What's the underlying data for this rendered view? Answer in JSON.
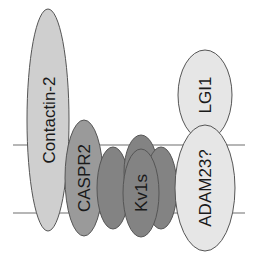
{
  "diagram": {
    "colors": {
      "background": "#ffffff",
      "membrane_line": "#6e6e6e",
      "outline": "#555555",
      "contactin_fill": "#cfcfcf",
      "caspr_fill": "#9a9a9a",
      "kv_fill": "#838383",
      "lgi_fill": "#e6e6e6",
      "adam_fill": "#e6e6e6",
      "text": "#1a1a1a"
    },
    "membrane": {
      "top_y": 145,
      "bottom_y": 213,
      "x_start": 13,
      "x_end": 245
    },
    "proteins": {
      "contactin": {
        "label": "Contactin-2"
      },
      "caspr": {
        "label": "CASPR2"
      },
      "kv": {
        "label": "Kv1s"
      },
      "lgi": {
        "label": "LGI1"
      },
      "adam": {
        "label": "ADAM23?"
      }
    }
  }
}
